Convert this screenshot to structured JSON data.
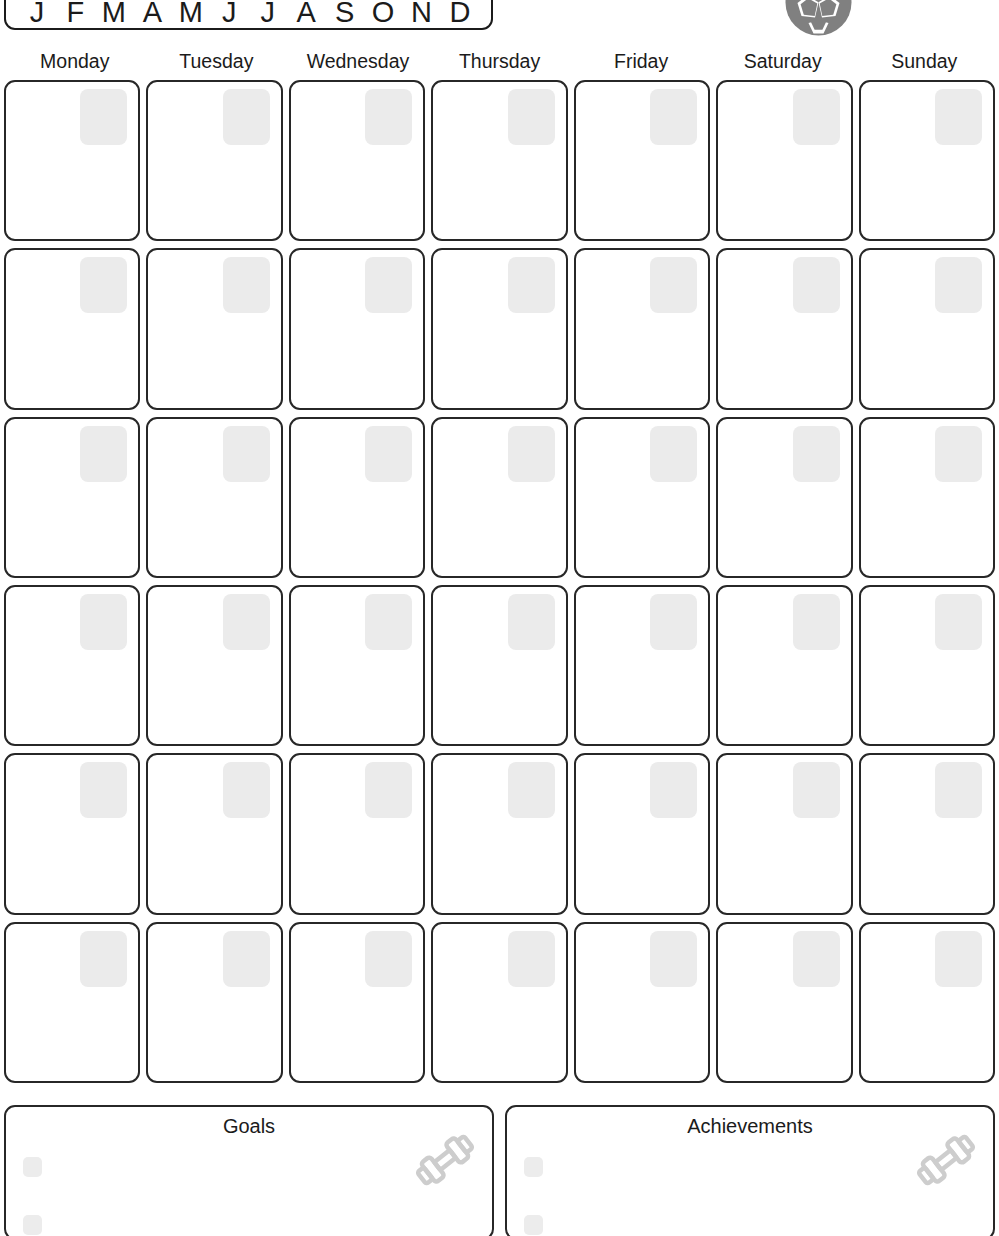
{
  "document": {
    "kind": "fitness-monthly-planner",
    "accent_color": "#808080",
    "ink_color": "#1b1b1b",
    "placeholder_color": "#ebebeb"
  },
  "month_selector": {
    "name": "month-abbreviation-strip",
    "letters": [
      "J",
      "F",
      "M",
      "A",
      "M",
      "J",
      "J",
      "A",
      "S",
      "O",
      "N",
      "D"
    ]
  },
  "header_icon": {
    "name": "soccer-ball-icon",
    "color": "#808080"
  },
  "weekdays": [
    {
      "label": "Monday"
    },
    {
      "label": "Tuesday"
    },
    {
      "label": "Wednesday"
    },
    {
      "label": "Thursday"
    },
    {
      "label": "Friday"
    },
    {
      "label": "Saturday"
    },
    {
      "label": "Sunday"
    }
  ],
  "calendar": {
    "rows": 6,
    "columns": 7,
    "cell_count": 42,
    "date_box_placeholder": "",
    "cells_blank": true
  },
  "panels": [
    {
      "title": "Goals",
      "checks": [
        "",
        ""
      ],
      "icon": "dumbbell-icon"
    },
    {
      "title": "Achievements",
      "checks": [
        "",
        ""
      ],
      "icon": "dumbbell-icon"
    }
  ]
}
